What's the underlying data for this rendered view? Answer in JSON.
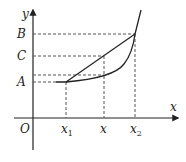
{
  "diagram": {
    "type": "function-graph",
    "axes": {
      "x_label": "x",
      "y_label": "y",
      "origin_label": "O"
    },
    "y_marks": [
      {
        "id": "B",
        "label": "B"
      },
      {
        "id": "C",
        "label": "C"
      },
      {
        "id": "A",
        "label": "A"
      }
    ],
    "x_marks": [
      {
        "id": "x1",
        "label": "x",
        "subscript": "1"
      },
      {
        "id": "x",
        "label": "x",
        "subscript": ""
      },
      {
        "id": "x2",
        "label": "x",
        "subscript": "2"
      }
    ],
    "elements": {
      "curve": "convex increasing function curve",
      "chord": "straight segment connecting curve points at x1 and x2",
      "guides": "dashed projection lines to axes"
    },
    "colors": {
      "stroke": "#222222",
      "dash": "#555555",
      "background": "#ffffff"
    }
  }
}
